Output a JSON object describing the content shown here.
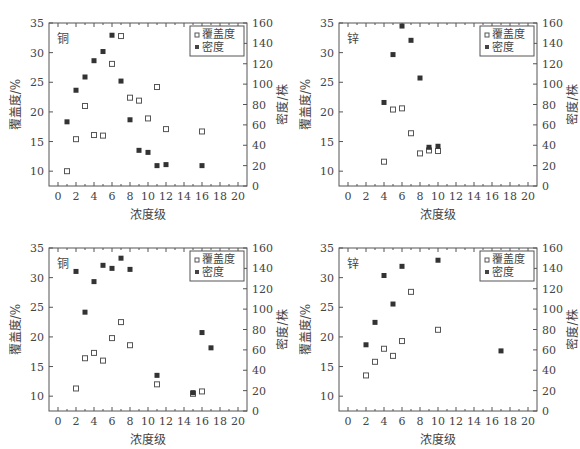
{
  "chart_data": [
    {
      "type": "scatter",
      "panel_label": "铜",
      "xlabel": "浓度级",
      "ylabel": "覆盖度/%",
      "y2label": "密度/株",
      "xlim": [
        -1,
        21
      ],
      "ylim": [
        7.5,
        35
      ],
      "y2lim": [
        0,
        160
      ],
      "xticks": [
        0,
        2,
        4,
        6,
        8,
        10,
        12,
        14,
        16,
        18,
        20
      ],
      "yticks": [
        10,
        15,
        20,
        25,
        30,
        35
      ],
      "y2ticks": [
        0,
        20,
        40,
        60,
        80,
        100,
        120,
        140,
        160
      ],
      "legend": [
        "覆盖度",
        "密度"
      ],
      "series": [
        {
          "name": "覆盖度",
          "axis": "left",
          "marker": "open-square",
          "x": [
            1,
            2,
            3,
            4,
            5,
            6,
            7,
            8,
            9,
            10,
            11,
            12,
            16
          ],
          "y": [
            10,
            15.4,
            21,
            16.1,
            16,
            28.1,
            32.8,
            22.4,
            21.9,
            18.9,
            24.2,
            17.1,
            16.7
          ]
        },
        {
          "name": "密度",
          "axis": "right",
          "marker": "filled-square",
          "x": [
            1,
            2,
            3,
            4,
            5,
            6,
            7,
            8,
            9,
            10,
            11,
            12,
            16
          ],
          "y": [
            63,
            94,
            107,
            123,
            132,
            148,
            103,
            65,
            35,
            33,
            20,
            21,
            20
          ]
        }
      ]
    },
    {
      "type": "scatter",
      "panel_label": "锌",
      "xlabel": "浓度级",
      "ylabel": "覆盖度/%",
      "y2label": "密度/株",
      "xlim": [
        -1,
        21
      ],
      "ylim": [
        7.5,
        35
      ],
      "y2lim": [
        0,
        160
      ],
      "xticks": [
        0,
        2,
        4,
        6,
        8,
        10,
        12,
        14,
        16,
        18,
        20
      ],
      "yticks": [
        10,
        15,
        20,
        25,
        30,
        35
      ],
      "y2ticks": [
        0,
        20,
        40,
        60,
        80,
        100,
        120,
        140,
        160
      ],
      "legend": [
        "覆盖度",
        "密度"
      ],
      "series": [
        {
          "name": "覆盖度",
          "axis": "left",
          "marker": "open-square",
          "x": [
            4,
            5,
            6,
            7,
            8,
            9,
            10
          ],
          "y": [
            11.6,
            20.4,
            20.6,
            16.4,
            13,
            13.5,
            13.4
          ]
        },
        {
          "name": "密度",
          "axis": "right",
          "marker": "filled-square",
          "x": [
            4,
            5,
            6,
            7,
            8,
            9,
            10
          ],
          "y": [
            82,
            129,
            157,
            143,
            106,
            38,
            39
          ]
        }
      ]
    },
    {
      "type": "scatter",
      "panel_label": "铜",
      "xlabel": "浓度级",
      "ylabel": "覆盖度/%",
      "y2label": "密度/株",
      "xlim": [
        -1,
        21
      ],
      "ylim": [
        7.5,
        35
      ],
      "y2lim": [
        0,
        160
      ],
      "xticks": [
        0,
        2,
        4,
        6,
        8,
        10,
        12,
        14,
        16,
        18,
        20
      ],
      "yticks": [
        10,
        15,
        20,
        25,
        30,
        35
      ],
      "y2ticks": [
        0,
        20,
        40,
        60,
        80,
        100,
        120,
        140,
        160
      ],
      "legend": [
        "覆盖度",
        "密度"
      ],
      "series": [
        {
          "name": "覆盖度",
          "axis": "left",
          "marker": "open-square",
          "x": [
            2,
            3,
            4,
            5,
            6,
            7,
            8,
            11,
            15,
            16
          ],
          "y": [
            11.3,
            16.4,
            17.3,
            16,
            19.8,
            22.5,
            18.6,
            12,
            10.4,
            10.8
          ]
        },
        {
          "name": "密度",
          "axis": "right",
          "marker": "filled-square",
          "x": [
            2,
            3,
            4,
            5,
            6,
            7,
            8,
            11,
            15,
            16,
            17
          ],
          "y": [
            137,
            97,
            127,
            143,
            140,
            150,
            139,
            35,
            18,
            77,
            62
          ]
        }
      ]
    },
    {
      "type": "scatter",
      "panel_label": "锌",
      "xlabel": "浓度级",
      "ylabel": "覆盖度/%",
      "y2label": "密度/株",
      "xlim": [
        -1,
        21
      ],
      "ylim": [
        7.5,
        35
      ],
      "y2lim": [
        0,
        160
      ],
      "xticks": [
        0,
        2,
        4,
        6,
        8,
        10,
        12,
        14,
        16,
        18,
        20
      ],
      "yticks": [
        10,
        15,
        20,
        25,
        30,
        35
      ],
      "y2ticks": [
        0,
        20,
        40,
        60,
        80,
        100,
        120,
        140,
        160
      ],
      "legend": [
        "覆盖度",
        "密度"
      ],
      "series": [
        {
          "name": "覆盖度",
          "axis": "left",
          "marker": "open-square",
          "x": [
            2,
            3,
            4,
            5,
            6,
            7,
            10
          ],
          "y": [
            13.5,
            15.8,
            18,
            16.8,
            19.3,
            27.6,
            21.2
          ]
        },
        {
          "name": "密度",
          "axis": "right",
          "marker": "filled-square",
          "x": [
            2,
            3,
            4,
            5,
            6,
            10,
            17
          ],
          "y": [
            65,
            87,
            133,
            105,
            142,
            148,
            59
          ]
        }
      ]
    }
  ]
}
